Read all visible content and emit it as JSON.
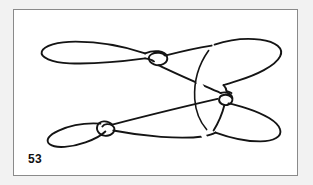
{
  "page": {
    "background_color": "#f2f2f2",
    "frame_color": "#8a8a8a",
    "ink_color": "#141414"
  },
  "figure": {
    "number": "53",
    "caption": "",
    "type": "knot-diagram"
  },
  "diagram": {
    "stroke_width": 1.9,
    "elements": [
      {
        "name": "upper-rope-left-bight",
        "kind": "loop"
      },
      {
        "name": "upper-rope-overhand-knot",
        "kind": "knot"
      },
      {
        "name": "upper-rope-right-bight",
        "kind": "loop"
      },
      {
        "name": "lower-rope-left-bight",
        "kind": "loop"
      },
      {
        "name": "lower-rope-overhand-knot",
        "kind": "knot"
      },
      {
        "name": "lower-rope-right-bight",
        "kind": "loop"
      },
      {
        "name": "central-crossing",
        "kind": "crossing"
      },
      {
        "name": "vertical-arc",
        "kind": "curve"
      }
    ]
  }
}
